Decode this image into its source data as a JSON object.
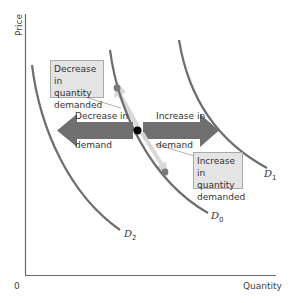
{
  "axes": {
    "y_label": "Price",
    "x_label": "Quantity",
    "origin_label": "0"
  },
  "curves": {
    "d0": {
      "name": "D",
      "subscript": "0"
    },
    "d1": {
      "name": "D",
      "subscript": "1"
    },
    "d2": {
      "name": "D",
      "subscript": "2"
    }
  },
  "arrows": {
    "decrease_demand": {
      "line1": "Decrease in",
      "line2": "demand"
    },
    "increase_demand": {
      "line1": "Increase in",
      "line2": "demand"
    }
  },
  "callouts": {
    "decrease_qd": {
      "line1": "Decrease in",
      "line2": "quantity",
      "line3": "demanded"
    },
    "increase_qd": {
      "line1": "Increase in",
      "line2": "quantity",
      "line3": "demanded"
    }
  },
  "colors": {
    "curve": "#6e6e6e",
    "shift_arrow": "#6f6f6f",
    "movement_arrow": "#d4d4d4",
    "dot_black": "#000000",
    "dot_gray": "#7a7a7a",
    "box_fill": "#e4e4e4",
    "axis": "#6a6a6a"
  }
}
